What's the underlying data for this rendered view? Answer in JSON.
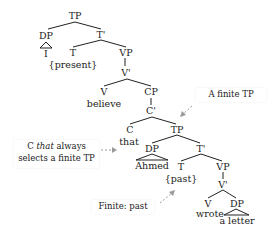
{
  "diagram": {
    "type": "syntax-tree",
    "nodes": {
      "tp_root": "TP",
      "dp_subj": "DP",
      "subj_word": "I",
      "t_bar_1": "T'",
      "t_1": "T",
      "t_1_feature": "{present}",
      "vp_1": "VP",
      "v_bar_1": "V'",
      "v_1": "V",
      "v_1_word": "believe",
      "cp": "CP",
      "c_bar": "C'",
      "c": "C",
      "c_word": "that",
      "tp_embedded": "TP",
      "dp_embedded": "DP",
      "dp_embedded_word": "Ahmed",
      "t_bar_2": "T'",
      "t_2": "T",
      "t_2_feature": "{past}",
      "vp_2": "VP",
      "v_bar_2": "V'",
      "v_2": "V",
      "v_2_word": "wrote",
      "dp_obj": "DP",
      "dp_obj_word": "a letter"
    },
    "callouts": {
      "finite_tp": "A finite TP",
      "c_that_line1_c": "C",
      "c_that_line1_that": "that",
      "c_that_line1_rest": "always",
      "c_that_line2": "selects a finite TP",
      "finite_past": "Finite: past"
    },
    "colors": {
      "line": "#222222",
      "arrow": "#999999",
      "background": "#ffffff"
    }
  }
}
